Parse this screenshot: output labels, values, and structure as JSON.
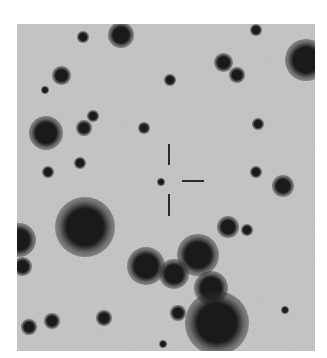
{
  "image": {
    "type": "astronomical finder chart (inverted grayscale)",
    "background_color": "#c9c9c9",
    "star_color": "#1a1a1a",
    "frame": {
      "left": 17,
      "top": 24,
      "width": 298,
      "height": 327
    }
  },
  "crosshair": {
    "color": "#2a2a2a",
    "vertical_top": {
      "x": 168,
      "y1": 144,
      "y2": 165
    },
    "vertical_bottom": {
      "x": 168,
      "y1": 194,
      "y2": 216
    },
    "horizontal_right": {
      "y": 180,
      "x1": 182,
      "x2": 204
    }
  },
  "stars": [
    {
      "x": 121,
      "y": 35,
      "r": 7
    },
    {
      "x": 83,
      "y": 37,
      "r": 3
    },
    {
      "x": 256,
      "y": 30,
      "r": 3
    },
    {
      "x": 306,
      "y": 60,
      "r": 11
    },
    {
      "x": 223,
      "y": 62,
      "r": 5
    },
    {
      "x": 237,
      "y": 75,
      "r": 4
    },
    {
      "x": 61,
      "y": 75,
      "r": 5
    },
    {
      "x": 170,
      "y": 80,
      "r": 3
    },
    {
      "x": 45,
      "y": 90,
      "r": 2
    },
    {
      "x": 93,
      "y": 116,
      "r": 3
    },
    {
      "x": 84,
      "y": 128,
      "r": 4
    },
    {
      "x": 46,
      "y": 133,
      "r": 9
    },
    {
      "x": 144,
      "y": 128,
      "r": 3
    },
    {
      "x": 258,
      "y": 124,
      "r": 3
    },
    {
      "x": 80,
      "y": 163,
      "r": 3
    },
    {
      "x": 48,
      "y": 172,
      "r": 3
    },
    {
      "x": 256,
      "y": 172,
      "r": 3
    },
    {
      "x": 283,
      "y": 186,
      "r": 6
    },
    {
      "x": 161,
      "y": 182,
      "r": 2
    },
    {
      "x": 85,
      "y": 227,
      "r": 16
    },
    {
      "x": 19,
      "y": 240,
      "r": 9
    },
    {
      "x": 22,
      "y": 266,
      "r": 5
    },
    {
      "x": 228,
      "y": 227,
      "r": 6
    },
    {
      "x": 247,
      "y": 230,
      "r": 3
    },
    {
      "x": 146,
      "y": 266,
      "r": 10
    },
    {
      "x": 174,
      "y": 274,
      "r": 8
    },
    {
      "x": 198,
      "y": 255,
      "r": 11
    },
    {
      "x": 211,
      "y": 288,
      "r": 9
    },
    {
      "x": 178,
      "y": 313,
      "r": 4
    },
    {
      "x": 104,
      "y": 318,
      "r": 4
    },
    {
      "x": 52,
      "y": 321,
      "r": 4
    },
    {
      "x": 29,
      "y": 327,
      "r": 4
    },
    {
      "x": 217,
      "y": 323,
      "r": 17
    },
    {
      "x": 285,
      "y": 310,
      "r": 2
    },
    {
      "x": 163,
      "y": 344,
      "r": 2
    }
  ]
}
